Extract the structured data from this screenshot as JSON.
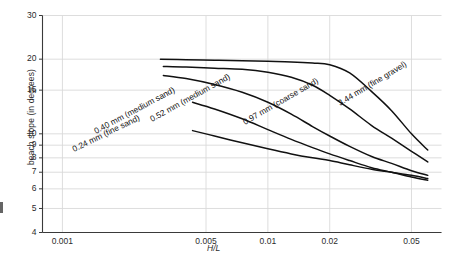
{
  "figure": {
    "background": "#ffffff",
    "axis_color": "#3a3a3a",
    "grid_color": "#d9d9d9",
    "curve_color": "#111111"
  },
  "chart_data": {
    "type": "line",
    "title": "",
    "subtitle": "",
    "xlabel": "H/L",
    "ylabel": "beach slope (in degrees)",
    "xscale": "log",
    "yscale": "log",
    "xlim": [
      0.0008,
      0.07
    ],
    "ylim": [
      4,
      30
    ],
    "grid": true,
    "legend": "inline-curve-labels",
    "xticks": [
      0.001,
      0.005,
      0.01,
      0.02,
      0.05
    ],
    "xtick_labels": [
      "0.001",
      "0.005",
      "0.01",
      "0.02",
      "0.05"
    ],
    "yticks": [
      4,
      5,
      6,
      7,
      8,
      9,
      10,
      15,
      20,
      30
    ],
    "ytick_labels": [
      "4",
      "5",
      "6",
      "7",
      "8",
      "9",
      "10",
      "15",
      "20",
      "30"
    ],
    "series": [
      {
        "name": "3.44 mm (fine gravel)",
        "label": "3.44 mm (fine gravel)",
        "x": [
          0.003,
          0.004,
          0.0055,
          0.0075,
          0.01,
          0.013,
          0.0165,
          0.02,
          0.025,
          0.032,
          0.04,
          0.05,
          0.06
        ],
        "y": [
          20.0,
          19.9,
          19.8,
          19.7,
          19.6,
          19.5,
          19.3,
          19.0,
          17.6,
          14.8,
          12.4,
          10.0,
          8.6
        ]
      },
      {
        "name": "0.97 mm (coarse sand)",
        "label": "0.97 mm (coarse sand)",
        "x": [
          0.0031,
          0.004,
          0.0055,
          0.0075,
          0.01,
          0.013,
          0.0165,
          0.02,
          0.025,
          0.032,
          0.04,
          0.05,
          0.06
        ],
        "y": [
          18.7,
          18.6,
          18.4,
          18.2,
          17.7,
          16.9,
          15.7,
          14.3,
          12.6,
          10.8,
          9.6,
          8.5,
          7.7
        ]
      },
      {
        "name": "0.52 mm (medium sand)",
        "label": "0.52 mm (medium sand)",
        "x": [
          0.0031,
          0.004,
          0.0055,
          0.0075,
          0.01,
          0.013,
          0.0165,
          0.02,
          0.025,
          0.032,
          0.04,
          0.05,
          0.06
        ],
        "y": [
          17.2,
          16.7,
          15.8,
          14.7,
          13.4,
          12.0,
          10.7,
          9.8,
          8.9,
          8.1,
          7.6,
          7.1,
          6.8
        ]
      },
      {
        "name": "0.40 mm (medium sand)",
        "label": "0.40 mm (medium sand)",
        "x": [
          0.0043,
          0.0055,
          0.0075,
          0.01,
          0.013,
          0.0165,
          0.02,
          0.025,
          0.032,
          0.04,
          0.05,
          0.06
        ],
        "y": [
          13.4,
          12.6,
          11.5,
          10.4,
          9.5,
          8.8,
          8.3,
          7.8,
          7.3,
          7.0,
          6.7,
          6.5
        ]
      },
      {
        "name": "0.24 mm (fine sand)",
        "label": "0.24 mm (fine sand)",
        "x": [
          0.0043,
          0.0055,
          0.0075,
          0.01,
          0.013,
          0.0165,
          0.02,
          0.025,
          0.032,
          0.04,
          0.05,
          0.06
        ],
        "y": [
          10.3,
          9.8,
          9.2,
          8.7,
          8.3,
          8.0,
          7.8,
          7.5,
          7.2,
          7.0,
          6.8,
          6.6
        ]
      }
    ]
  }
}
